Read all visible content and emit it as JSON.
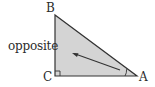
{
  "diagram": {
    "vertices": {
      "B": {
        "label": "B",
        "x": 55,
        "y": 15
      },
      "C": {
        "label": "C",
        "x": 55,
        "y": 76
      },
      "A": {
        "label": "A",
        "x": 137,
        "y": 76
      }
    },
    "side_labels": {
      "opposite": "opposite"
    },
    "right_angle_at": "C",
    "marked_angle_at": "A",
    "arrow": {
      "from": {
        "x": 120,
        "y": 70
      },
      "to": {
        "x": 73,
        "y": 53
      },
      "meaning": "points from angle A toward the opposite side BC"
    },
    "colors": {
      "fill": "#d4d4d4",
      "stroke": "#333333",
      "text": "#2b2b2b"
    }
  }
}
